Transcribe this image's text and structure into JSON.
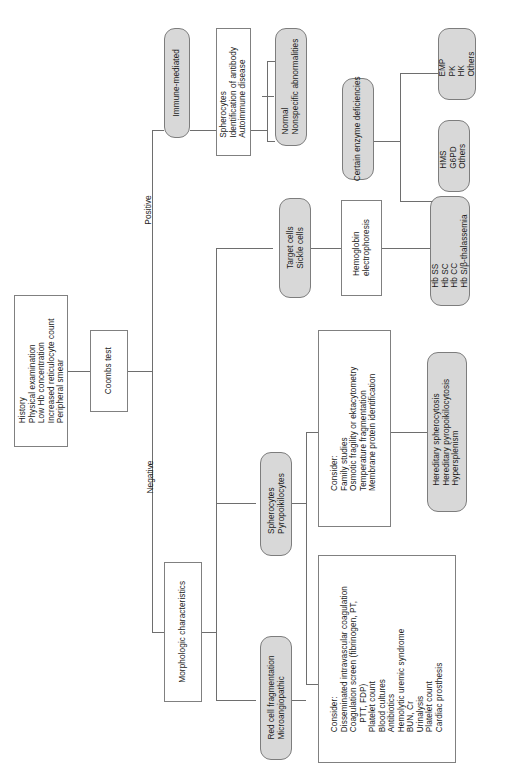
{
  "diagram": {
    "orientation": "rotated-90",
    "colors": {
      "node_fill_gray": "#d8d8d8",
      "node_fill_white": "#ffffff",
      "border": "#7d7d7d",
      "connector": "#6e6e6e",
      "text": "#1a1a1a"
    }
  },
  "nodes": {
    "initial_workup": {
      "shape": "rect",
      "text": "History\nPhysical examination\nLow Hb concentration\nIncreased reticulocyte count\nPeripheral smear"
    },
    "coombs_test": {
      "shape": "rect",
      "text": "Coombs test"
    },
    "morphologic_characteristics": {
      "shape": "rect",
      "text": "Morphologic characteristics"
    },
    "immune_mediated": {
      "shape": "rounded",
      "text": "Immune-mediated"
    },
    "immune_workup": {
      "shape": "rect",
      "text": "Spherocytes\nIdentification of antibody\nAutoimmune disease"
    },
    "normal_nonspecific": {
      "shape": "rounded",
      "text": "Normal\nNonspecific abnormalities"
    },
    "certain_enzyme_deficiencies": {
      "shape": "rounded",
      "text": "Certain enzyme deficiencies"
    },
    "enzyme_emp": {
      "shape": "rounded",
      "text": "EMP\nPK\nHK\nOthers"
    },
    "enzyme_hms": {
      "shape": "rounded",
      "text": "HMS\nG6PD\nOthers"
    },
    "target_sickle_cells": {
      "shape": "rounded",
      "text": "Target cells\nSickle cells"
    },
    "hemoglobin_electrophoresis": {
      "shape": "rect",
      "text": "Hemoglobin\nelectrophoresis"
    },
    "hemoglobinopathies": {
      "shape": "rounded",
      "text": "Hb SS\nHb SC\nHb CC\nHb S/β-thalassemia"
    },
    "spherocytes_pyropoikilocytes": {
      "shape": "rounded",
      "text": "Spherocytes\nPyropoikilocytes"
    },
    "membrane_consider": {
      "shape": "rect",
      "text": "Consider:\nFamily studies\nOsmotic fragility or ektacytometry\nTemperature fragmentation\nMembrane protein identification"
    },
    "membrane_disorders": {
      "shape": "rounded",
      "text": "Hereditary spherocytosis\nHereditary pyropoikilocytosis\nHypersplenism"
    },
    "red_cell_fragmentation": {
      "shape": "rounded",
      "text": "Red cell fragmentation\nMicroangiopathic"
    },
    "fragmentation_consider": {
      "shape": "rect",
      "text": "Consider:\nDisseminated intravascular coagulation\nCoagulation screen (fibrinogen, PT,\n    PTT, FDP)\nPlatelet count\nBlood cultures\nAntibiotics\nHemolytic uremic syndrome\nBUN, Cr\nUrinalysis\nPlatelet count\nCardiac prosthesis"
    }
  },
  "edge_labels": {
    "positive": "Positive",
    "negative": "Negative"
  }
}
